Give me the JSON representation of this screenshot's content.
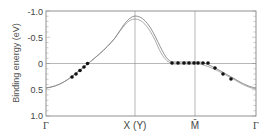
{
  "chart_data": {
    "type": "line",
    "title": "",
    "xlabel": "",
    "ylabel": "Binding energy (eV)",
    "ylim": [
      1.0,
      -1.0
    ],
    "y_inverted": true,
    "y_ticks": [
      "-1.0",
      "-0.5",
      "0",
      "0.5",
      "1.0"
    ],
    "x_ticks": [
      "Γ",
      "X (Y)",
      "M̄",
      "Γ"
    ],
    "grid": false,
    "reference_lines": {
      "horizontal": [
        0
      ],
      "vertical": [
        "X (Y)",
        "M̄"
      ]
    },
    "series": [
      {
        "name": "band-calculation-1",
        "style": "line",
        "x": [
          0.0,
          0.1,
          0.2,
          0.3,
          0.4,
          0.45,
          0.5,
          0.55,
          0.6,
          0.7,
          0.75,
          0.8,
          0.9,
          1.0,
          1.1,
          1.2,
          1.3,
          1.4,
          1.5
        ],
        "values": [
          0.47,
          0.42,
          0.28,
          0.05,
          -0.25,
          -0.5,
          -0.78,
          -0.9,
          -0.84,
          -0.4,
          -0.1,
          -0.05,
          -0.02,
          0.0,
          0.05,
          0.15,
          0.28,
          0.38,
          0.47
        ]
      },
      {
        "name": "band-calculation-2",
        "style": "line",
        "x": [
          0.0,
          0.1,
          0.2,
          0.3,
          0.4,
          0.45,
          0.5,
          0.55,
          0.6,
          0.7,
          0.75,
          0.8,
          0.9,
          1.0,
          1.1,
          1.2,
          1.3,
          1.4,
          1.5
        ],
        "values": [
          0.47,
          0.42,
          0.28,
          0.05,
          -0.25,
          -0.5,
          -0.75,
          -0.86,
          -0.8,
          -0.35,
          -0.05,
          0.0,
          0.0,
          0.02,
          0.08,
          0.18,
          0.3,
          0.4,
          0.47
        ]
      },
      {
        "name": "experimental-points",
        "style": "scatter",
        "x": [
          0.18,
          0.2,
          0.22,
          0.24,
          0.26,
          0.85,
          0.88,
          0.91,
          0.94,
          0.97,
          1.0,
          1.03,
          1.06,
          1.1,
          1.16,
          1.22
        ],
        "values": [
          0.27,
          0.21,
          0.15,
          0.1,
          0.02,
          0.0,
          0.0,
          0.0,
          0.0,
          0.0,
          0.0,
          0.0,
          0.0,
          0.1,
          0.2,
          0.3
        ]
      }
    ]
  },
  "axis": {
    "y_title": "Binding energy (eV)",
    "y_ticks": [
      "-1.0",
      "-0.5",
      "0",
      "0.5",
      "1.0"
    ],
    "x_ticks": [
      "Γ",
      "X (Y)",
      "M̄",
      "Γ"
    ]
  }
}
